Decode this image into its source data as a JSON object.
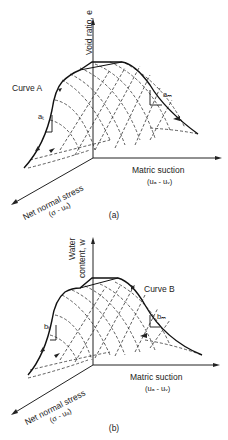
{
  "figures": [
    {
      "id": "a",
      "caption": "(a)",
      "vertical_axis": "Void ratio, e",
      "horizontal_axis": {
        "line1": "Matric suction",
        "line2": "(uₐ - uᵥ)"
      },
      "diagonal_axis": {
        "line1": "Net normal stress",
        "line2": "(σ - uₐ)"
      },
      "curve_label": "Curve A",
      "slope_left": "aₜ",
      "slope_right": "aₘ"
    },
    {
      "id": "b",
      "caption": "(b)",
      "vertical_axis": {
        "line1": "Water",
        "line2": "content, w"
      },
      "horizontal_axis": {
        "line1": "Matric suction",
        "line2": "(uₐ - uᵥ)"
      },
      "diagonal_axis": {
        "line1": "Net normal stress",
        "line2": "(σ - uₐ)"
      },
      "curve_label": "Curve B",
      "slope_left": "bₜ",
      "slope_right": "bₘ"
    }
  ]
}
